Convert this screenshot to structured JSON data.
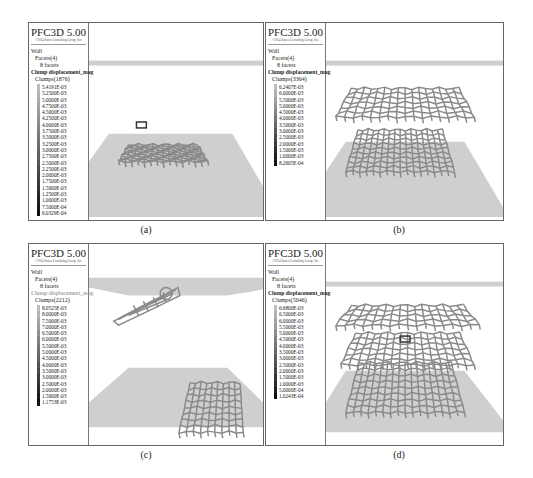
{
  "figure": {
    "panels": [
      {
        "id": "a",
        "caption": "(a)",
        "legend": {
          "title": "PFC3D 5.00",
          "copyright": "©2014 Itasca Consulting Group, Inc.",
          "wall_label": "Wall",
          "facets_label": "Facets(4)",
          "facets_sub": "8 facets",
          "contour_label": "Clump displacement_mag",
          "clumps_label": "Clumps(1876)",
          "scale_values": [
            "5.4191E-03",
            "5.2500E-03",
            "5.0000E-03",
            "4.7500E-03",
            "4.5000E-03",
            "4.2500E-03",
            "4.0000E-03",
            "3.7500E-03",
            "3.5000E-03",
            "3.2500E-03",
            "3.0000E-03",
            "2.7500E-03",
            "2.5000E-03",
            "2.2500E-03",
            "2.0000E-03",
            "1.7500E-03",
            "1.5000E-03",
            "1.2500E-03",
            "1.0000E-03",
            "7.5000E-04",
            "6.0329E-04"
          ]
        }
      },
      {
        "id": "b",
        "caption": "(b)",
        "legend": {
          "title": "PFC3D 5.00",
          "copyright": "©2014 Itasca Consulting Group, Inc.",
          "wall_label": "Wall",
          "facets_label": "Facets(4)",
          "facets_sub": "8 facets",
          "contour_label": "Clump displacement_mag",
          "clumps_label": "Clumps(3364)",
          "scale_values": [
            "6.2407E-03",
            "6.0000E-03",
            "5.5000E-03",
            "5.0000E-03",
            "4.5000E-03",
            "4.0000E-03",
            "3.5000E-03",
            "3.0000E-03",
            "2.5000E-03",
            "2.0000E-03",
            "1.5000E-03",
            "1.0000E-03",
            "8.2605E-04"
          ]
        }
      },
      {
        "id": "c",
        "caption": "(c)",
        "legend": {
          "title": "PFC3D 5.00",
          "copyright": "©2014 Itasca Consulting Group, Inc.",
          "wall_label": "Wall",
          "facets_label": "Facets(4)",
          "facets_sub": "8 facets",
          "contour_label": "Clump displacement_mag",
          "clumps_label": "Clumps(2212)",
          "scale_values": [
            "8.0525E-03",
            "8.0000E-03",
            "7.5000E-03",
            "7.0000E-03",
            "6.5000E-03",
            "6.0000E-03",
            "5.5000E-03",
            "5.0000E-03",
            "4.5000E-03",
            "4.0000E-03",
            "3.5000E-03",
            "3.0000E-03",
            "2.5000E-03",
            "2.0000E-03",
            "1.5000E-03",
            "1.1753E-03"
          ]
        }
      },
      {
        "id": "d",
        "caption": "(d)",
        "legend": {
          "title": "PFC3D 5.00",
          "copyright": "©2014 Itasca Consulting Group, Inc.",
          "wall_label": "Wall",
          "facets_label": "Facets(4)",
          "facets_sub": "8 facets",
          "contour_label": "Clump displacement_mag",
          "clumps_label": "Clumps(5046)",
          "scale_values": [
            "6.6800E-03",
            "6.5000E-03",
            "6.0000E-03",
            "5.5000E-03",
            "5.0000E-03",
            "4.5000E-03",
            "4.0000E-03",
            "3.5000E-03",
            "3.0000E-03",
            "2.5000E-03",
            "2.0000E-03",
            "1.5000E-03",
            "1.0000E-03",
            "5.0000E-04",
            "1.0243E-04"
          ]
        }
      }
    ]
  },
  "colors": {
    "frame": "#666666",
    "wall_plane": "#cfcfcf",
    "mesh": "#8a8a8a",
    "mesh_dark": "#3a3a3a"
  }
}
